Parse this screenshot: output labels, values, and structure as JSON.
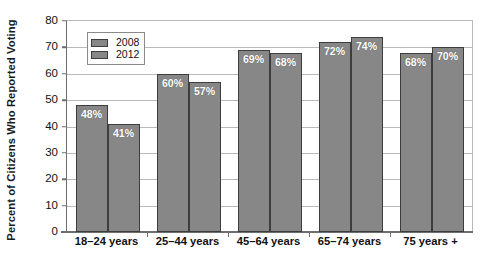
{
  "chart_data": {
    "type": "bar",
    "title": "",
    "xlabel": "",
    "ylabel": "Percent of Citizens Who Reported Voting",
    "ylim": [
      0,
      80
    ],
    "yticks": [
      0,
      10,
      20,
      30,
      40,
      50,
      60,
      70,
      80
    ],
    "ytick_labels": [
      "0",
      "10",
      "20",
      "30",
      "40",
      "50",
      "60",
      "70",
      "80"
    ],
    "grid": true,
    "legend_position": "upper left inside",
    "categories": [
      "18–24 years",
      "25–44 years",
      "45–64 years",
      "65–74 years",
      "75 years +"
    ],
    "series": [
      {
        "name": "2008",
        "color": "#878787",
        "values": [
          48,
          60,
          69,
          72,
          68
        ],
        "data_labels": [
          "48%",
          "60%",
          "69%",
          "72%",
          "68%"
        ]
      },
      {
        "name": "2012",
        "color": "#878787",
        "values": [
          41,
          57,
          68,
          74,
          70
        ],
        "data_labels": [
          "41%",
          "57%",
          "68%",
          "74%",
          "70%"
        ]
      }
    ]
  },
  "legend": {
    "items": [
      {
        "label": "2008",
        "swatch_color": "#878787"
      },
      {
        "label": "2012",
        "swatch_color": "#878787"
      }
    ]
  },
  "colors": {
    "bar_fill": "#878787",
    "bar_border": "#3d3d3d",
    "gridline": "#b9b9b9",
    "axis": "#6e6e6e",
    "text": "#111111",
    "data_label": "#ffffff",
    "background": "#ffffff"
  }
}
